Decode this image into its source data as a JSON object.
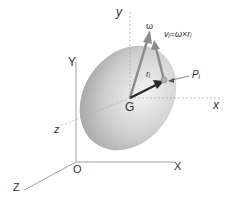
{
  "diagram": {
    "type": "rigid-body-kinematics",
    "labels": {
      "fixed_Y": "Y",
      "fixed_X": "X",
      "fixed_Z": "Z",
      "origin": "O",
      "body_y": "y",
      "body_x": "x",
      "body_z": "z",
      "center": "G",
      "omega": "ω",
      "velocity_eq": "vᵢ=ω×rᵢ",
      "position_vec": "rᵢ",
      "point": "Pᵢ"
    },
    "colors": {
      "ellipsoid_light": "#f2f2f2",
      "ellipsoid_dark": "#9a9a9a",
      "axis_line": "#888888",
      "dashed_axis": "#b0b0b0",
      "arrow_gray": "#8c8c8c",
      "arrow_dark": "#2a2a2a"
    }
  }
}
